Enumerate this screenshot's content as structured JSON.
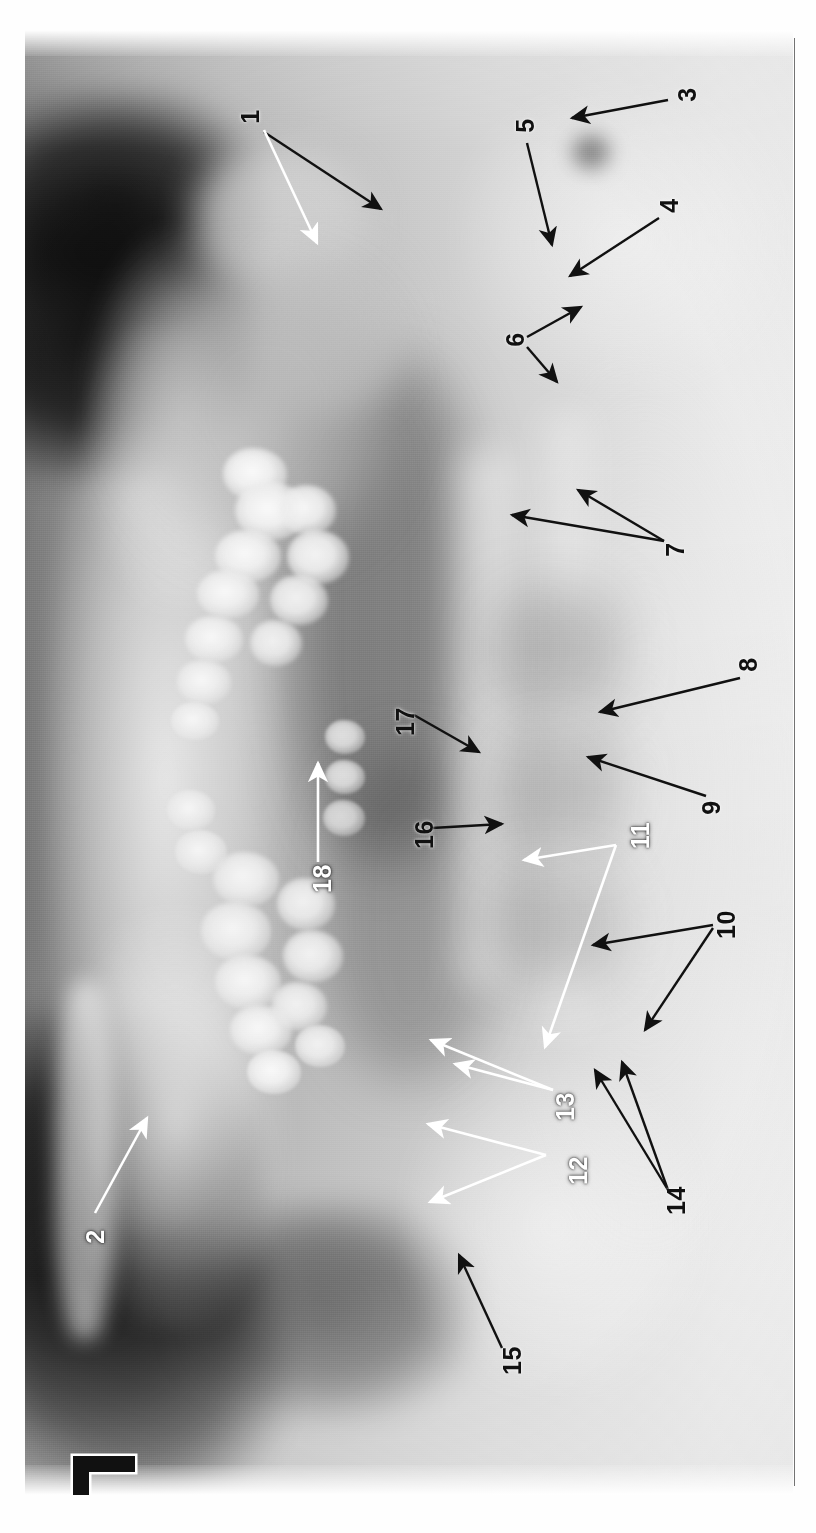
{
  "image": {
    "kind": "panoramic-dental-radiograph",
    "orientation": "rotated-90-ccw",
    "width": 816,
    "height": 1533,
    "background_color": "#ffffff",
    "side_marker": "L",
    "side_marker_color": "#000000"
  },
  "annotations": {
    "count": 18,
    "items": [
      {
        "id": "1",
        "label": "1",
        "color": "#111111",
        "x": 253,
        "y": 117,
        "arrows": 2
      },
      {
        "id": "2",
        "label": "2",
        "color": "#ffffff",
        "x": 98,
        "y": 1237,
        "arrows": 1
      },
      {
        "id": "3",
        "label": "3",
        "color": "#111111",
        "x": 690,
        "y": 95,
        "arrows": 1
      },
      {
        "id": "4",
        "label": "4",
        "color": "#111111",
        "x": 672,
        "y": 206,
        "arrows": 1
      },
      {
        "id": "5",
        "label": "5",
        "color": "#111111",
        "x": 528,
        "y": 126,
        "arrows": 1
      },
      {
        "id": "6",
        "label": "6",
        "color": "#111111",
        "x": 518,
        "y": 340,
        "arrows": 2
      },
      {
        "id": "7",
        "label": "7",
        "color": "#111111",
        "x": 678,
        "y": 550,
        "arrows": 2
      },
      {
        "id": "8",
        "label": "8",
        "color": "#111111",
        "x": 751,
        "y": 665,
        "arrows": 1
      },
      {
        "id": "9",
        "label": "9",
        "color": "#111111",
        "x": 714,
        "y": 808,
        "arrows": 1
      },
      {
        "id": "10",
        "label": "10",
        "color": "#111111",
        "x": 726,
        "y": 930,
        "arrows": 2
      },
      {
        "id": "11",
        "label": "11",
        "color": "#ffffff",
        "x": 641,
        "y": 841,
        "arrows": 2
      },
      {
        "id": "12",
        "label": "12",
        "color": "#ffffff",
        "x": 578,
        "y": 1176,
        "arrows": 2
      },
      {
        "id": "13",
        "label": "13",
        "color": "#ffffff",
        "x": 565,
        "y": 1112,
        "arrows": 2
      },
      {
        "id": "14",
        "label": "14",
        "color": "#111111",
        "x": 676,
        "y": 1206,
        "arrows": 2
      },
      {
        "id": "15",
        "label": "15",
        "color": "#111111",
        "x": 508,
        "y": 1361,
        "arrows": 1
      },
      {
        "id": "16",
        "label": "16",
        "color": "#111111",
        "x": 420,
        "y": 835,
        "arrows": 1
      },
      {
        "id": "17",
        "label": "17",
        "color": "#111111",
        "x": 401,
        "y": 722,
        "arrows": 1
      },
      {
        "id": "18",
        "label": "18",
        "color": "#ffffff",
        "x": 322,
        "y": 880,
        "arrows": 1
      }
    ]
  }
}
